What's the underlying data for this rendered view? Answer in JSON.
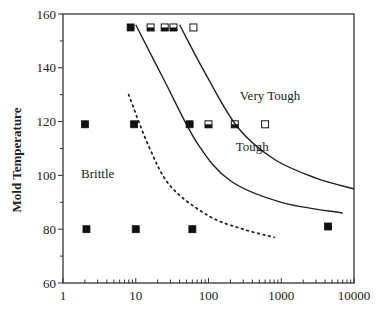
{
  "chart_data": {
    "type": "scatter",
    "title": "",
    "xlabel": "",
    "ylabel": "Mold  Temperature",
    "xscale": "log",
    "xlim": [
      1,
      10000
    ],
    "ylim": [
      60,
      160
    ],
    "x_ticks": [
      1,
      10,
      100,
      1000,
      10000
    ],
    "x_tick_labels": [
      "1",
      "10",
      "100",
      "1000",
      "10000"
    ],
    "y_ticks": [
      60,
      80,
      100,
      120,
      140,
      160
    ],
    "y_tick_labels": [
      "60",
      "80",
      "100",
      "120",
      "140",
      "160"
    ],
    "grid": false,
    "legend": null,
    "series": [
      {
        "name": "Brittle (filled squares)",
        "marker": "filled-square",
        "points": [
          {
            "x": 8.5,
            "y": 155
          },
          {
            "x": 2,
            "y": 119
          },
          {
            "x": 9.5,
            "y": 119
          },
          {
            "x": 55,
            "y": 119
          },
          {
            "x": 2.1,
            "y": 80
          },
          {
            "x": 10,
            "y": 80
          },
          {
            "x": 60,
            "y": 80
          },
          {
            "x": 4400,
            "y": 81
          }
        ]
      },
      {
        "name": "Tough (half-filled squares)",
        "marker": "half-filled-square",
        "points": [
          {
            "x": 16,
            "y": 155
          },
          {
            "x": 25,
            "y": 155
          },
          {
            "x": 33,
            "y": 155
          },
          {
            "x": 100,
            "y": 119
          },
          {
            "x": 230,
            "y": 119
          }
        ]
      },
      {
        "name": "Very Tough (open squares)",
        "marker": "open-square",
        "points": [
          {
            "x": 62,
            "y": 155
          },
          {
            "x": 600,
            "y": 119
          }
        ]
      }
    ],
    "curves": [
      {
        "name": "brittle-tough boundary (dotted)",
        "style": "dotted",
        "points": [
          [
            8,
            130
          ],
          [
            15,
            111
          ],
          [
            30,
            96
          ],
          [
            100,
            85
          ],
          [
            300,
            80
          ],
          [
            800,
            77
          ]
        ]
      },
      {
        "name": "tough boundary (solid inner)",
        "style": "solid",
        "points": [
          [
            10,
            156
          ],
          [
            25,
            135
          ],
          [
            70,
            112
          ],
          [
            200,
            98
          ],
          [
            1000,
            90
          ],
          [
            7000,
            86
          ]
        ]
      },
      {
        "name": "very-tough boundary (solid outer)",
        "style": "solid",
        "points": [
          [
            40,
            156
          ],
          [
            90,
            138
          ],
          [
            250,
            118
          ],
          [
            800,
            106
          ],
          [
            3000,
            99
          ],
          [
            10000,
            95
          ]
        ]
      }
    ],
    "annotations": [
      {
        "text": "Very Tough",
        "x": 700,
        "y": 128
      },
      {
        "text": "Tough",
        "x": 400,
        "y": 109
      },
      {
        "text": "Brittle",
        "x": 3,
        "y": 99
      }
    ]
  },
  "labels": {
    "ylabel": "Mold  Temperature",
    "very_tough": "Very Tough",
    "tough": "Tough",
    "brittle": "Brittle",
    "x_ticks": [
      "1",
      "10",
      "100",
      "1000",
      "10000"
    ],
    "y_ticks": [
      "60",
      "80",
      "100",
      "120",
      "140",
      "160"
    ]
  }
}
